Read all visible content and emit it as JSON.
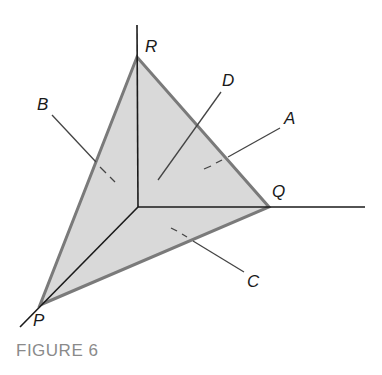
{
  "figure": {
    "caption": "FIGURE 6",
    "colors": {
      "face_fill": "#d9d9d9",
      "face_edge": "#7a7a7a",
      "axis": "#1a1a1a",
      "leader": "#444444",
      "caption": "#8a8a8a"
    },
    "vertices": {
      "P": "P",
      "Q": "Q",
      "R": "R"
    },
    "regions": {
      "A": "A",
      "B": "B",
      "C": "C",
      "D": "D"
    }
  }
}
